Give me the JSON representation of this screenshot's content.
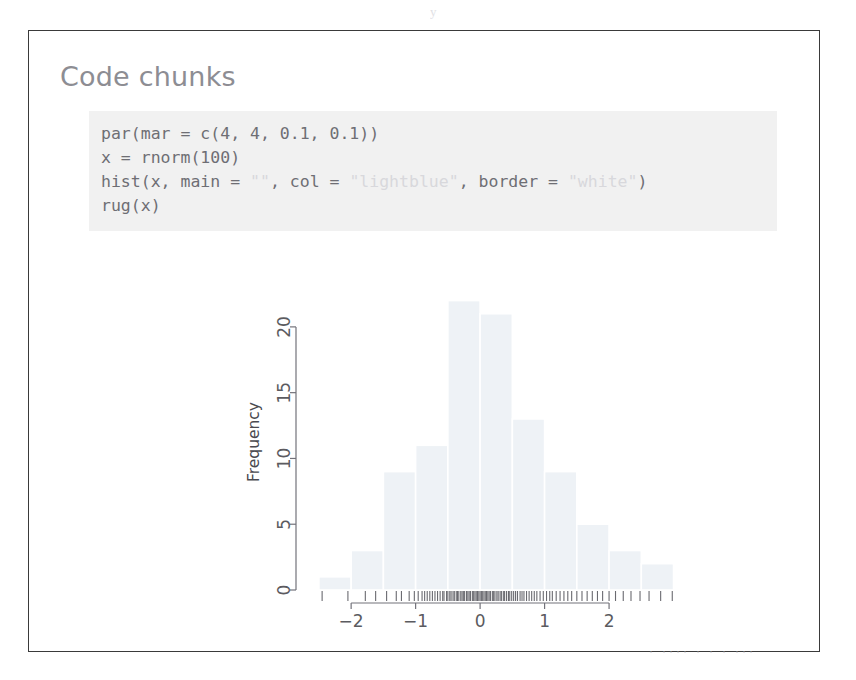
{
  "page": {
    "scan_artifact_top": "y",
    "scan_artifact_bottom": "·  ····  ·  ·  · ···"
  },
  "slide": {
    "title": "Code chunks"
  },
  "code_chunk": {
    "language": "r",
    "lines": [
      {
        "parts": [
          {
            "text": "par(mar = c(4, 4, 0.1, 0.1))",
            "type": "code"
          }
        ]
      },
      {
        "parts": [
          {
            "text": "x = rnorm(100)",
            "type": "code"
          }
        ]
      },
      {
        "parts": [
          {
            "text": "hist(x, main = ",
            "type": "code"
          },
          {
            "text": "\"\"",
            "type": "string"
          },
          {
            "text": ", col = ",
            "type": "code"
          },
          {
            "text": "\"lightblue\"",
            "type": "string"
          },
          {
            "text": ", border = ",
            "type": "code"
          },
          {
            "text": "\"white\"",
            "type": "string"
          },
          {
            "text": ")",
            "type": "code"
          }
        ]
      },
      {
        "parts": [
          {
            "text": "rug(x)",
            "type": "code"
          }
        ]
      }
    ],
    "background_color": "#f1f1f1",
    "text_color": "#6e6e74",
    "string_color": "#d8d8dc"
  },
  "chart_data": {
    "type": "bar",
    "subtype": "histogram",
    "title": "",
    "xlabel": "",
    "ylabel": "Frequency",
    "bin_width": 0.5,
    "bin_edges": [
      -2.5,
      -2.0,
      -1.5,
      -1.0,
      -0.5,
      0.0,
      0.5,
      1.0,
      1.5,
      2.0,
      2.5,
      3.0
    ],
    "categories": [
      "-2.5",
      "-2.0",
      "-1.5",
      "-1.0",
      "-0.5",
      "0.0",
      "0.5",
      "1.0",
      "1.5",
      "2.0",
      "2.5"
    ],
    "values": [
      1,
      3,
      9,
      11,
      22,
      21,
      13,
      9,
      5,
      3,
      2
    ],
    "n": 100,
    "xlim": [
      -2.7,
      3.1
    ],
    "ylim": [
      0,
      22.5
    ],
    "xticks": [
      -2,
      -1,
      0,
      1,
      2
    ],
    "xticklabels": [
      "−2",
      "−1",
      "0",
      "1",
      "2"
    ],
    "yticks": [
      0,
      5,
      10,
      15,
      20
    ],
    "yticklabels": [
      "0",
      "5",
      "10",
      "15",
      "20"
    ],
    "bar_color": "#eef2f6",
    "bar_border_color": "#ffffff",
    "grid": false,
    "legend": false,
    "rug": true,
    "rug_values": [
      -2.45,
      -2.05,
      -1.78,
      -1.62,
      -1.45,
      -1.3,
      -1.22,
      -1.1,
      -1.02,
      -0.96,
      -0.9,
      -0.86,
      -0.82,
      -0.78,
      -0.74,
      -0.7,
      -0.66,
      -0.62,
      -0.58,
      -0.56,
      -0.52,
      -0.5,
      -0.47,
      -0.45,
      -0.42,
      -0.4,
      -0.37,
      -0.35,
      -0.33,
      -0.3,
      -0.28,
      -0.26,
      -0.24,
      -0.21,
      -0.19,
      -0.17,
      -0.15,
      -0.12,
      -0.1,
      -0.08,
      -0.06,
      -0.04,
      -0.02,
      0.0,
      0.02,
      0.04,
      0.06,
      0.08,
      0.1,
      0.12,
      0.14,
      0.16,
      0.19,
      0.21,
      0.23,
      0.26,
      0.28,
      0.31,
      0.33,
      0.36,
      0.38,
      0.41,
      0.44,
      0.46,
      0.49,
      0.52,
      0.55,
      0.58,
      0.62,
      0.65,
      0.68,
      0.72,
      0.76,
      0.8,
      0.84,
      0.88,
      0.93,
      0.98,
      1.03,
      1.08,
      1.12,
      1.18,
      1.24,
      1.3,
      1.36,
      1.42,
      1.5,
      1.58,
      1.66,
      1.74,
      1.82,
      1.9,
      2.0,
      2.1,
      2.22,
      2.34,
      2.48,
      2.62,
      2.8,
      2.98
    ]
  }
}
